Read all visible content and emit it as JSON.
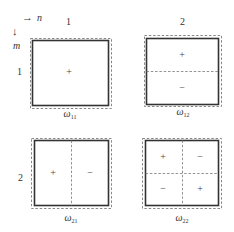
{
  "axes": {
    "n_label": "n",
    "m_label": "m",
    "arrow_n": "→",
    "arrow_m": "↓"
  },
  "columns": [
    "1",
    "2"
  ],
  "rows": [
    "1",
    "2"
  ],
  "modes": [
    {
      "id": "w11",
      "caption_main": "ω",
      "caption_sub": "11",
      "outer_dashed": [
        30,
        38,
        111,
        108
      ],
      "inner_solid": [
        32,
        40,
        108,
        105
      ],
      "dividers": [],
      "signs": [
        {
          "symbol": "+",
          "x": 69,
          "y": 72
        }
      ]
    },
    {
      "id": "w12",
      "caption_main": "ω",
      "caption_sub": "12",
      "outer_dashed": [
        144,
        35,
        221,
        106
      ],
      "inner_solid": [
        146,
        38,
        218,
        104
      ],
      "dividers": [
        {
          "orient": "h",
          "pos": 71
        }
      ],
      "signs": [
        {
          "symbol": "+",
          "x": 182,
          "y": 55
        },
        {
          "symbol": "−",
          "x": 182,
          "y": 88
        }
      ]
    },
    {
      "id": "w21",
      "caption_main": "ω",
      "caption_sub": "21",
      "outer_dashed": [
        31,
        138,
        111,
        208
      ],
      "inner_solid": [
        34,
        140,
        108,
        205
      ],
      "dividers": [
        {
          "orient": "v",
          "pos": 71
        }
      ],
      "signs": [
        {
          "symbol": "+",
          "x": 53,
          "y": 173
        },
        {
          "symbol": "−",
          "x": 90,
          "y": 173
        }
      ]
    },
    {
      "id": "w22",
      "caption_main": "ω",
      "caption_sub": "22",
      "outer_dashed": [
        142,
        138,
        221,
        208
      ],
      "inner_solid": [
        145,
        140,
        218,
        205
      ],
      "dividers": [
        {
          "orient": "h",
          "pos": 173
        },
        {
          "orient": "v",
          "pos": 182
        }
      ],
      "signs": [
        {
          "symbol": "+",
          "x": 163,
          "y": 157
        },
        {
          "symbol": "−",
          "x": 200,
          "y": 157
        },
        {
          "symbol": "−",
          "x": 163,
          "y": 189
        },
        {
          "symbol": "+",
          "x": 200,
          "y": 189
        }
      ]
    }
  ],
  "colors": {
    "solid": "#333333",
    "dashed": "#888888",
    "divider": "#777777"
  }
}
